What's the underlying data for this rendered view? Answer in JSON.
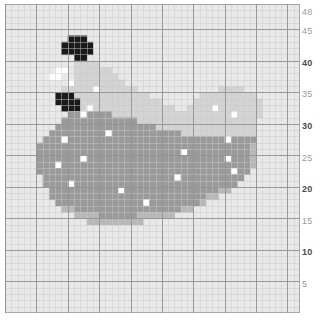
{
  "meta": {
    "view_kind": "pixel-grid-pattern"
  },
  "colors": {
    "background": "#ffffff",
    "grid_background": "#e8e8e8",
    "grid_line_minor": "#c9c9c9",
    "grid_line_major": "#8f8f8f",
    "shade_white": "#ffffff",
    "shade_light": "#d3d3d3",
    "shade_medium": "#b8b8b8",
    "shade_dark": "#9a9a9a",
    "shade_black": "#1a1a1a",
    "axis_label_minor": "#9a9a9a",
    "axis_label_major": "#4a4a4a"
  },
  "grid": {
    "columns": 47,
    "rows": 49,
    "cell_size": 6.28,
    "major_every": 5,
    "origin_x": 5,
    "origin_y": 4,
    "width": 295,
    "height": 309
  },
  "y_axis": {
    "position": "right",
    "ticks": [
      {
        "label": "48",
        "value": 48,
        "major": false
      },
      {
        "label": "45",
        "value": 45,
        "major": false
      },
      {
        "label": "40",
        "value": 40,
        "major": true
      },
      {
        "label": "35",
        "value": 35,
        "major": false
      },
      {
        "label": "30",
        "value": 30,
        "major": true
      },
      {
        "label": "25",
        "value": 25,
        "major": false
      },
      {
        "label": "20",
        "value": 20,
        "major": true
      },
      {
        "label": "15",
        "value": 15,
        "major": false
      },
      {
        "label": "10",
        "value": 10,
        "major": true
      },
      {
        "label": "5",
        "value": 5,
        "major": false
      }
    ]
  },
  "chart_data": {
    "type": "heatmap",
    "title": "",
    "xlabel": "",
    "ylabel": "",
    "legend": [
      {
        "key": "K",
        "name": "black",
        "color": "#1a1a1a"
      },
      {
        "key": "D",
        "name": "dark-gray",
        "color": "#9a9a9a"
      },
      {
        "key": "M",
        "name": "medium-gray",
        "color": "#b8b8b8"
      },
      {
        "key": "L",
        "name": "light-gray",
        "color": "#d3d3d3"
      },
      {
        "key": "W",
        "name": "white",
        "color": "#ffffff"
      },
      {
        "key": ".",
        "name": "empty",
        "color": null
      }
    ],
    "grid_on": true,
    "xlim": [
      0,
      47
    ],
    "ylim": [
      0,
      49
    ],
    "rows_top_to_bottom": [
      ".............................................",
      ".............................................",
      ".............................................",
      ".............................................",
      ".............................................",
      "..........KKK................................",
      ".........KKKKK...............................",
      ".........KKKKK...............................",
      "...........KK................................",
      "...........LLLL..............................",
      "........WW.LLLLLL............................",
      ".......WW..LLLLLLL...........................",
      "..........WLLLLLLLL..........................",
      ".........LLLLLWLLLLLL.............LLLL.......",
      "........KKKLLLLLLLLLLLL........LLLLLLLLL.....",
      "........KKKKLLLLLLLLLLLLL.....LLLLLLLLLLL....",
      ".........KKKLWLLLLLLLLLLLLL..LLLLWLLLLLLL....",
      "..........DDWDDDDLLLLLLLLLLLLLLLLLLLWLLLL....",
      ".........DDDDDDDDDDDDLLLLLLLLLLLLLLLLLLL.....",
      "........DDDDDDDDDDDDDDDDLLLLLLLLLLLLLLLL.....",
      ".......DDDDDDDDDWDDDDDDDDDDDLLLLLLLLLLLL.....",
      "......DDDWDDDDDDDDDDDDDDDDDDDDDDDDDWDDDD.....",
      ".....DDDDDDDDDDDDDDDDDDDDDDDDDDDDDDDDDDM....",
      ".....DDDDDDDDDDDDDDDDDDDDDDDWDDDDDDDDDDM....",
      ".....DDDDDDDWDDDDDDDDDDDDDDDDDDDDDDWDDDM....",
      ".....DDDWDDDDDDDDDDDDDDDDDDDDDDDDDDDDDDM....",
      ".....DDDDDDDDDDDDDDDDDDDDDDDDDDDDDDDWDD.....",
      "......DDDDDDDDDDDDDDDDDDDDDWDDDDDDDDDD......",
      "......DDDDWDDDDDDDDDDDDDDDDDDDDDDDDDD.......",
      ".......DDDDDDDDDDDWDDDDDDDDDDDDDDDMM........",
      ".......DDDDDDDDDDDDDDDDDDDDDDDDDMM..........",
      "........DDDDDDDDDDDDDDWDDDDDDDDM............",
      ".........MMDDDDDDDDDDDDDDDDDMM..............",
      "...........MMMMDDDDDDMMMMMM.................",
      ".............MMMMMMMMM......................",
      ".............................................",
      ".............................................",
      ".............................................",
      ".............................................",
      ".............................................",
      ".............................................",
      ".............................................",
      ".............................................",
      ".............................................",
      ".............................................",
      ".............................................",
      ".............................................",
      ".............................................",
      "............................................."
    ]
  }
}
